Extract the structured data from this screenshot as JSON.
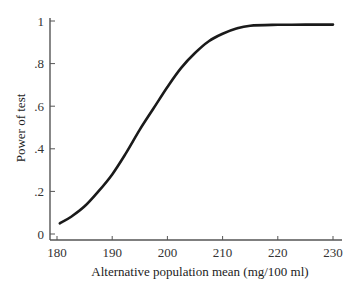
{
  "chart_data": {
    "type": "line",
    "title": "",
    "xlabel": "Alternative population mean (mg/100 ml)",
    "ylabel": "Power of test",
    "xlim": [
      180,
      230
    ],
    "ylim": [
      0,
      1
    ],
    "grid": false,
    "legend": null,
    "x_ticks": [
      180,
      190,
      200,
      210,
      220,
      230
    ],
    "x_tick_labels": [
      "180",
      "190",
      "200",
      "210",
      "220",
      "230"
    ],
    "y_ticks": [
      0,
      0.2,
      0.4,
      0.6,
      0.8,
      1
    ],
    "y_tick_labels": [
      "0",
      ".2",
      ".4",
      ".6",
      ".8",
      "1"
    ],
    "series": [
      {
        "name": "Power curve",
        "color": "#1a1a1a",
        "x": [
          180.5,
          182.5,
          185,
          187.5,
          190,
          192.5,
          195,
          197.5,
          200,
          202.5,
          205,
          207.5,
          210,
          212.5,
          215,
          220,
          225,
          230
        ],
        "y": [
          0.05,
          0.08,
          0.13,
          0.2,
          0.28,
          0.38,
          0.49,
          0.59,
          0.69,
          0.78,
          0.85,
          0.905,
          0.94,
          0.965,
          0.978,
          0.982,
          0.983,
          0.983
        ]
      }
    ]
  }
}
